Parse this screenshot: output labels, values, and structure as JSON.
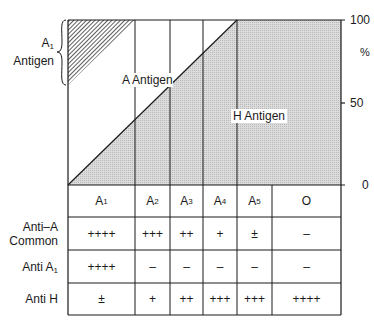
{
  "diagram": {
    "left_label_line1": "A",
    "left_label_sub": "1",
    "left_label_line2": "Antigen",
    "region_a_label": "A Antigen",
    "region_h_label": "H Antigen",
    "axis": {
      "tick_100": "100",
      "unit": "%",
      "tick_50": "50",
      "tick_0": "0"
    },
    "columns": [
      {
        "base": "A",
        "sub": "1"
      },
      {
        "base": "A",
        "sub": "2"
      },
      {
        "base": "A",
        "sub": "3"
      },
      {
        "base": "A",
        "sub": "4"
      },
      {
        "base": "A",
        "sub": "5"
      },
      {
        "base": "O",
        "sub": ""
      }
    ],
    "rows": [
      {
        "label_line1": "Anti–A",
        "label_line2": "Common",
        "values": [
          "++++",
          "+++",
          "++",
          "+",
          "±",
          "–"
        ]
      },
      {
        "label_line1": "Anti A",
        "label_sub": "1",
        "values": [
          "++++",
          "–",
          "–",
          "–",
          "–",
          "–"
        ]
      },
      {
        "label_line1": "Anti H",
        "values": [
          "±",
          "+",
          "++",
          "+++",
          "+++",
          "++++"
        ]
      }
    ],
    "colors": {
      "h_fill": "#d4d4d4",
      "line": "#1a1a1a",
      "hatch": "#1a1a1a"
    }
  }
}
